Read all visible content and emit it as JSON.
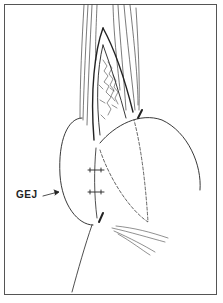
{
  "figure": {
    "type": "surgical line illustration",
    "labels": [
      {
        "id": "gej",
        "text": "GEJ",
        "pointer": "arrow"
      }
    ],
    "colors": {
      "ink": "#222222",
      "frame": "#555555",
      "background": "#ffffff"
    }
  }
}
